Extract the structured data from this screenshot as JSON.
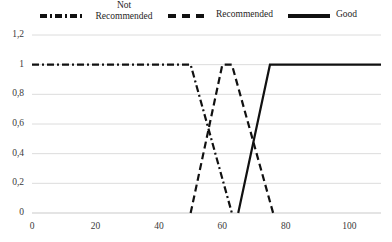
{
  "chart_data": {
    "type": "line",
    "title": "",
    "subtitle": "",
    "xlabel": "",
    "ylabel": "",
    "xlim": [
      0,
      110
    ],
    "ylim": [
      0,
      1.2
    ],
    "grid": "horizontal",
    "legend_position": "top",
    "x_ticks": [
      0,
      20,
      40,
      60,
      80,
      100
    ],
    "x_tick_labels": [
      "0",
      "20",
      "40",
      "60",
      "80",
      "100"
    ],
    "y_ticks": [
      0,
      0.2,
      0.4,
      0.6,
      0.8,
      1,
      1.2
    ],
    "y_tick_labels": [
      "0",
      "0,2",
      "0,4",
      "0,6",
      "0,8",
      "1",
      "1,2"
    ],
    "series": [
      {
        "name": "Not\nRecommended",
        "legend_label": "Not\nRecommended",
        "style": "dash-dot",
        "color": "#111111",
        "points": [
          [
            0,
            1
          ],
          [
            50,
            1
          ],
          [
            63,
            0
          ]
        ]
      },
      {
        "name": "Recommended",
        "legend_label": "Recommended",
        "style": "dashed",
        "color": "#111111",
        "points": [
          [
            50,
            0
          ],
          [
            60,
            1
          ],
          [
            63,
            1
          ],
          [
            76,
            0
          ]
        ]
      },
      {
        "name": "Good",
        "legend_label": "Good",
        "style": "solid",
        "color": "#111111",
        "points": [
          [
            65,
            0
          ],
          [
            75,
            1
          ],
          [
            110,
            1
          ]
        ]
      }
    ]
  },
  "legend": {
    "items": [
      {
        "label": "Not\nRecommended",
        "style": "dash-dot"
      },
      {
        "label": "Recommended",
        "style": "dashed"
      },
      {
        "label": "Good",
        "style": "solid"
      }
    ]
  },
  "axes": {
    "y_labels": [
      "1,2",
      "1",
      "0,8",
      "0,6",
      "0,4",
      "0,2",
      "0"
    ],
    "x_labels": [
      "0",
      "20",
      "40",
      "60",
      "80",
      "100"
    ]
  }
}
